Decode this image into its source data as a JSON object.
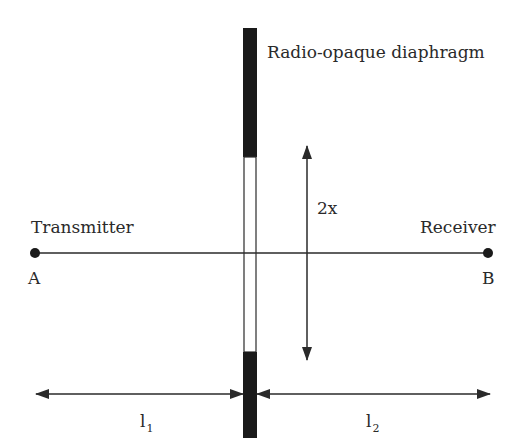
{
  "diagram": {
    "diaphragm_label": "Radio-opaque diaphragm",
    "transmitter_label": "Transmitter",
    "receiver_label": "Receiver",
    "point_a": "A",
    "point_b": "B",
    "aperture_label": "2x",
    "l1": {
      "base": "l",
      "sub": "1"
    },
    "l2": {
      "base": "l",
      "sub": "2"
    }
  },
  "colors": {
    "ink": "#2a2a2a",
    "background": "#ffffff"
  }
}
